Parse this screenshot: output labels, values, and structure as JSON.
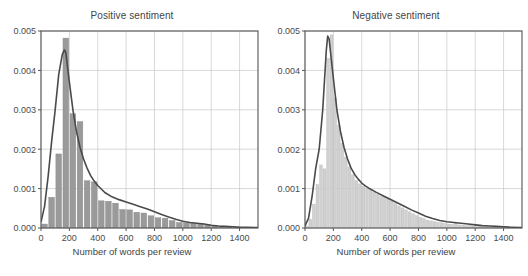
{
  "figure": {
    "width": 528,
    "height": 276,
    "background": "#ffffff"
  },
  "panels": [
    {
      "id": "positive",
      "title": "Positive sentiment",
      "xlabel": "Number of words per review"
    },
    {
      "id": "negative",
      "title": "Negative sentiment",
      "xlabel": "Number of words per review"
    }
  ],
  "style": {
    "bar_fill_left": "#9a9a9a",
    "bar_fill_right": "#d0d0d0",
    "bar_edge_left": "#8a8a8a",
    "bar_edge_right": "#b8b8b8",
    "kde_line": "#4a4a4a",
    "grid": "#c9c9c9",
    "frame": "#555555",
    "text": "#444444"
  },
  "chart_data": [
    {
      "type": "bar",
      "id": "positive",
      "title": "Positive sentiment",
      "xlabel": "Number of words per review",
      "ylabel": "",
      "xlim": [
        0,
        1530
      ],
      "ylim": [
        0,
        0.005
      ],
      "xticks": [
        0,
        200,
        400,
        600,
        800,
        1000,
        1200,
        1400
      ],
      "yticks": [
        0.0,
        0.001,
        0.002,
        0.003,
        0.004,
        0.005
      ],
      "xticklabels": [
        "0",
        "200",
        "400",
        "600",
        "800",
        "1000",
        "1200",
        "1400"
      ],
      "yticklabels": [
        "0.000",
        "0.001",
        "0.002",
        "0.003",
        "0.004",
        "0.005"
      ],
      "grid": true,
      "legend": null,
      "bin_width": 50,
      "bin_left_edges": [
        0,
        50,
        100,
        150,
        200,
        250,
        300,
        350,
        400,
        450,
        500,
        550,
        600,
        650,
        700,
        750,
        800,
        850,
        900,
        950,
        1000,
        1050,
        1100,
        1150,
        1200,
        1250,
        1300,
        1350,
        1400,
        1450,
        1500
      ],
      "values": [
        0.0001,
        0.00078,
        0.00188,
        0.00482,
        0.0029,
        0.0027,
        0.0012,
        0.00117,
        0.00069,
        0.00068,
        0.00063,
        0.00047,
        0.00046,
        0.0004,
        0.00038,
        0.00031,
        0.00026,
        0.00025,
        0.00019,
        0.00014,
        0.00013,
        0.00012,
        0.00011,
        8e-05,
        6e-05,
        5e-05,
        4e-05,
        3e-05,
        2e-05,
        2e-05,
        1e-05
      ],
      "kde": {
        "name": "density-curve",
        "x": [
          0,
          25,
          50,
          75,
          100,
          125,
          150,
          165,
          175,
          200,
          225,
          250,
          275,
          300,
          325,
          350,
          375,
          400,
          450,
          500,
          550,
          600,
          650,
          700,
          750,
          800,
          850,
          900,
          950,
          1000,
          1050,
          1100,
          1150,
          1200,
          1250,
          1300,
          1350,
          1400,
          1450,
          1530
        ],
        "y": [
          0.00015,
          0.00055,
          0.0013,
          0.0022,
          0.003,
          0.0039,
          0.0044,
          0.00452,
          0.00445,
          0.0037,
          0.003,
          0.00245,
          0.00205,
          0.00175,
          0.00152,
          0.00133,
          0.00119,
          0.00108,
          0.0009,
          0.00079,
          0.00072,
          0.00066,
          0.0006,
          0.00054,
          0.00048,
          0.00041,
          0.00034,
          0.00028,
          0.00022,
          0.00017,
          0.00014,
          0.00012,
          0.0001,
          7e-05,
          5e-05,
          4e-05,
          3e-05,
          2e-05,
          2e-05,
          1e-05
        ]
      }
    },
    {
      "type": "bar",
      "id": "negative",
      "title": "Negative sentiment",
      "xlabel": "Number of words per review",
      "ylabel": "",
      "xlim": [
        0,
        1530
      ],
      "ylim": [
        0,
        0.005
      ],
      "xticks": [
        0,
        200,
        400,
        600,
        800,
        1000,
        1200,
        1400
      ],
      "yticks": [
        0.0,
        0.001,
        0.002,
        0.003,
        0.004,
        0.005
      ],
      "xticklabels": [
        "0",
        "200",
        "400",
        "600",
        "800",
        "1000",
        "1200",
        "1400"
      ],
      "yticklabels": [
        "0.000",
        "0.001",
        "0.002",
        "0.003",
        "0.004",
        "0.005"
      ],
      "grid": true,
      "legend": null,
      "bin_width": 25,
      "bin_left_edges": [
        0,
        25,
        50,
        75,
        100,
        125,
        150,
        175,
        200,
        225,
        250,
        275,
        300,
        325,
        350,
        375,
        400,
        425,
        450,
        475,
        500,
        525,
        550,
        575,
        600,
        625,
        650,
        675,
        700,
        725,
        750,
        775,
        800,
        825,
        850,
        875,
        900,
        925,
        950,
        975,
        1000,
        1025,
        1050,
        1075,
        1100,
        1125,
        1150,
        1175,
        1200,
        1225,
        1250,
        1275,
        1300,
        1325,
        1350,
        1375,
        1400,
        1425,
        1450,
        1475,
        1500
      ],
      "values": [
        5e-05,
        0.00022,
        0.0006,
        0.0011,
        0.0016,
        0.0015,
        0.0043,
        0.0049,
        0.0033,
        0.0026,
        0.00215,
        0.0018,
        0.00155,
        0.00135,
        0.0012,
        0.00112,
        0.00105,
        0.001,
        0.00095,
        0.0009,
        0.00085,
        0.0008,
        0.00077,
        0.00073,
        0.00068,
        0.00062,
        0.00056,
        0.00051,
        0.00046,
        0.00041,
        0.00036,
        0.00031,
        0.00027,
        0.00024,
        0.0002,
        0.00018,
        0.00016,
        0.00014,
        0.00013,
        0.00011,
        0.0001,
        9e-05,
        0.00012,
        8e-05,
        7e-05,
        6e-05,
        6e-05,
        5e-05,
        8e-05,
        4e-05,
        3e-05,
        3e-05,
        2e-05,
        2e-05,
        2e-05,
        1e-05,
        1e-05,
        1e-05,
        1e-05,
        1e-05,
        1e-05
      ],
      "kde": {
        "name": "density-curve",
        "x": [
          0,
          25,
          50,
          75,
          100,
          125,
          150,
          160,
          170,
          185,
          200,
          225,
          250,
          275,
          300,
          325,
          350,
          375,
          400,
          425,
          450,
          500,
          550,
          600,
          650,
          700,
          750,
          800,
          850,
          900,
          950,
          1000,
          1050,
          1100,
          1150,
          1200,
          1250,
          1300,
          1350,
          1400,
          1450,
          1530
        ],
        "y": [
          5e-05,
          0.00025,
          0.0008,
          0.0015,
          0.002,
          0.003,
          0.0045,
          0.00487,
          0.0048,
          0.0043,
          0.0038,
          0.003,
          0.00245,
          0.00205,
          0.00175,
          0.00152,
          0.00136,
          0.00124,
          0.00114,
          0.00107,
          0.00101,
          0.00091,
          0.00082,
          0.00073,
          0.00064,
          0.00055,
          0.00046,
          0.00038,
          0.0003,
          0.00024,
          0.00019,
          0.00016,
          0.00014,
          0.00012,
          0.0001,
          8e-05,
          6e-05,
          5e-05,
          4e-05,
          3e-05,
          2e-05,
          1e-05
        ]
      }
    }
  ]
}
